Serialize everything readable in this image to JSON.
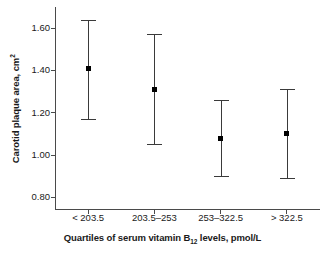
{
  "chart_data": {
    "type": "scatter",
    "title": "",
    "xlabel": "Quartiles of serum vitamin B12 levels, pmol/L",
    "xlabel_main": "Quartiles of serum vitamin B",
    "xlabel_sub": "12",
    "xlabel_tail": " levels, pmol/L",
    "ylabel": "Carotid plaque area, cm2",
    "ylabel_main": "Carotid plaque area, cm",
    "ylabel_sup": "2",
    "categories": [
      "< 203.5",
      "203.5–253",
      "253–322.5",
      "> 322.5"
    ],
    "values": [
      1.41,
      1.31,
      1.08,
      1.1
    ],
    "error_low": [
      1.17,
      1.05,
      0.9,
      0.89
    ],
    "error_high": [
      1.64,
      1.57,
      1.26,
      1.31
    ],
    "ylim": [
      0.74,
      1.7
    ],
    "yticks": [
      0.8,
      1.0,
      1.2,
      1.4,
      1.6
    ],
    "ytick_labels": [
      "0.80",
      "1.00",
      "1.20",
      "1.40",
      "1.60"
    ],
    "grid": false,
    "legend": null,
    "marker": "square",
    "marker_color": "#000000",
    "errorbar_color": "#3a3a3a",
    "axis_color": "#4a4a4a",
    "background": "#ffffff"
  }
}
